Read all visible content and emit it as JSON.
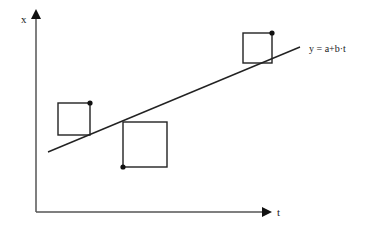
{
  "diagram": {
    "type": "regression-residual-squares",
    "axes": {
      "y_label": "x",
      "x_label": "t"
    },
    "line": {
      "equation_label": "y = a+b·t",
      "x1": 48,
      "y1": 152,
      "x2": 300,
      "y2": 47
    },
    "squares": [
      {
        "name": "square-left",
        "x": 58,
        "y": 103,
        "size": 32,
        "point": {
          "x": 90,
          "y": 103
        }
      },
      {
        "name": "square-middle",
        "x": 123,
        "y": 122,
        "size": 45,
        "point": {
          "x": 123,
          "y": 167
        }
      },
      {
        "name": "square-top-right",
        "x": 243,
        "y": 33,
        "size": 29,
        "point": {
          "x": 272,
          "y": 33
        }
      }
    ],
    "colors": {
      "stroke": "#222222",
      "axis": "#555555",
      "background": "#ffffff"
    }
  }
}
